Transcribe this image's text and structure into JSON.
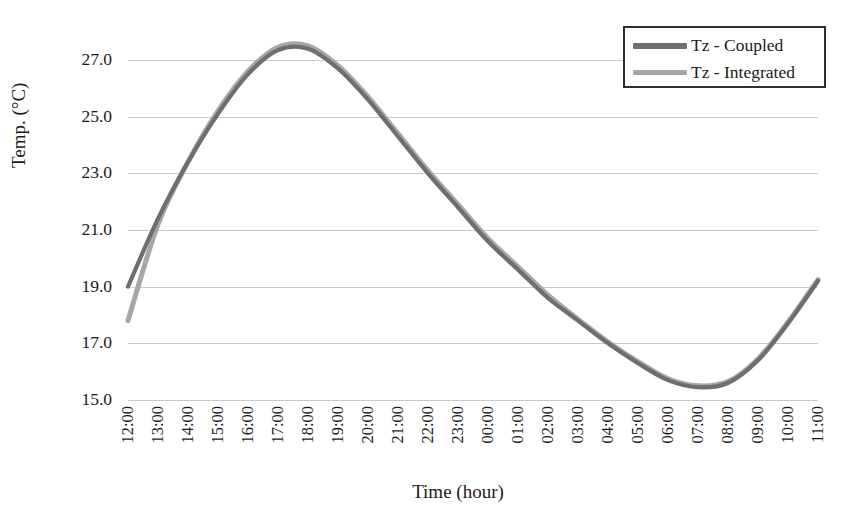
{
  "chart_data": {
    "type": "line",
    "title": "",
    "xlabel": "Time (hour)",
    "ylabel": "Temp. (°C)",
    "ylim": [
      15.0,
      27.0
    ],
    "ytick_labels": [
      "27.0",
      "25.0",
      "23.0",
      "21.0",
      "19.0",
      "17.0",
      "15.0"
    ],
    "ytick_values": [
      27.0,
      25.0,
      23.0,
      21.0,
      19.0,
      17.0,
      15.0
    ],
    "grid": true,
    "legend_position": "top-right",
    "categories": [
      "12:00",
      "13:00",
      "14:00",
      "15:00",
      "16:00",
      "17:00",
      "18:00",
      "19:00",
      "20:00",
      "21:00",
      "22:00",
      "23:00",
      "00:00",
      "01:00",
      "02:00",
      "03:00",
      "04:00",
      "05:00",
      "06:00",
      "07:00",
      "08:00",
      "09:00",
      "10:00",
      "11:00"
    ],
    "series": [
      {
        "name": "Tz - Coupled",
        "color": "#6e6e6e",
        "values": [
          19.0,
          21.4,
          23.4,
          25.1,
          26.5,
          27.35,
          27.4,
          26.7,
          25.6,
          24.3,
          23.0,
          21.8,
          20.6,
          19.6,
          18.6,
          17.8,
          17.0,
          16.3,
          15.7,
          15.45,
          15.6,
          16.4,
          17.7,
          19.2
        ]
      },
      {
        "name": "Tz - Integrated",
        "color": "#a6a6a6",
        "values": [
          17.8,
          21.2,
          23.4,
          25.2,
          26.6,
          27.45,
          27.5,
          26.8,
          25.7,
          24.4,
          23.1,
          21.9,
          20.7,
          19.7,
          18.7,
          17.85,
          17.05,
          16.35,
          15.75,
          15.5,
          15.65,
          16.45,
          17.75,
          19.25
        ]
      }
    ]
  },
  "legend": {
    "entries": [
      {
        "label": "Tz - Coupled",
        "color": "#6e6e6e",
        "swatch_name": "legend-swatch-coupled"
      },
      {
        "label": "Tz - Integrated",
        "color": "#a6a6a6",
        "swatch_name": "legend-swatch-integrated"
      }
    ]
  },
  "axes": {
    "x_title": "Time (hour)",
    "y_title": "Temp. (°C)"
  },
  "colors": {
    "gridline": "#c9c9c9",
    "legend_border": "#2e2e2e",
    "text": "#1a1a1a",
    "background": "#ffffff"
  }
}
